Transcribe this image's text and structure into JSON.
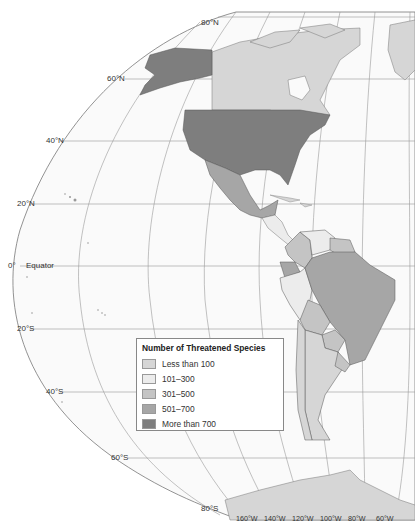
{
  "map": {
    "title": "Number of Threatened Species",
    "projection": "elliptical",
    "latitude_labels": [
      {
        "text": "80°N",
        "x": 201,
        "y": 23
      },
      {
        "text": "60°N",
        "x": 107,
        "y": 76
      },
      {
        "text": "40°N",
        "x": 46,
        "y": 138
      },
      {
        "text": "20°N",
        "x": 17,
        "y": 201
      },
      {
        "text": "0°",
        "x": 8,
        "y": 263
      },
      {
        "text": "Equator",
        "x": 26,
        "y": 263
      },
      {
        "text": "20°S",
        "x": 17,
        "y": 326
      },
      {
        "text": "40°S",
        "x": 46,
        "y": 390
      },
      {
        "text": "60°S",
        "x": 111,
        "y": 456
      },
      {
        "text": "80°S",
        "x": 201,
        "y": 505
      }
    ],
    "longitude_labels": [
      "160°W",
      "140°W",
      "120°W",
      "100°W",
      "80°W",
      "60°W"
    ],
    "legend": {
      "title": "Number of Threatened Species",
      "items": [
        {
          "label": "Less than 100",
          "color": "#d6d6d6"
        },
        {
          "label": "101–300",
          "color": "#ececec"
        },
        {
          "label": "301–500",
          "color": "#c4c4c4"
        },
        {
          "label": "501–700",
          "color": "#a6a6a6"
        },
        {
          "label": "More than 700",
          "color": "#7e7e7e"
        }
      ]
    },
    "regions": [
      {
        "name": "United States (incl. Alaska)",
        "category": "More than 700"
      },
      {
        "name": "Canada",
        "category": "Less than 100"
      },
      {
        "name": "Greenland",
        "category": "Less than 100"
      },
      {
        "name": "Mexico",
        "category": "501–700"
      },
      {
        "name": "Central America",
        "category": "101–300"
      },
      {
        "name": "Colombia",
        "category": "301–500"
      },
      {
        "name": "Ecuador",
        "category": "501–700"
      },
      {
        "name": "Venezuela",
        "category": "101–300"
      },
      {
        "name": "Guianas",
        "category": "301–500"
      },
      {
        "name": "Brazil",
        "category": "501–700"
      },
      {
        "name": "Peru",
        "category": "101–300"
      },
      {
        "name": "Bolivia",
        "category": "301–500"
      },
      {
        "name": "Paraguay",
        "category": "301–500"
      },
      {
        "name": "Chile",
        "category": "Less than 100"
      },
      {
        "name": "Argentina",
        "category": "Less than 100"
      },
      {
        "name": "Uruguay",
        "category": "301–500"
      },
      {
        "name": "Antarctica",
        "category": "Less than 100"
      }
    ]
  }
}
